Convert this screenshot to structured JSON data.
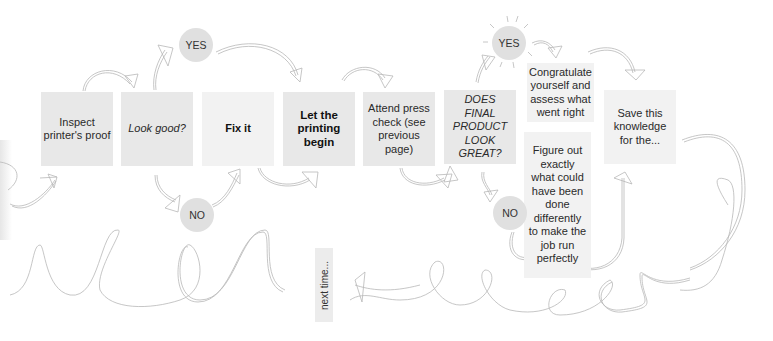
{
  "diagram": {
    "steps": [
      {
        "id": "inspect",
        "label": "Inspect printer's proof"
      },
      {
        "id": "look-good",
        "label": "Look good?"
      },
      {
        "id": "fix",
        "label": "Fix it"
      },
      {
        "id": "print",
        "label": "Let the printing begin"
      },
      {
        "id": "press-check",
        "label": "Attend press check (see previous page)"
      },
      {
        "id": "final-check",
        "label": "DOES FINAL PRODUCT LOOK GREAT?"
      },
      {
        "id": "congratulate",
        "label": "Congratulate yourself and assess what went right"
      },
      {
        "id": "figure-out",
        "label": "Figure out exactly what could have been done differently to make the job run perfectly"
      },
      {
        "id": "save",
        "label": "Save this knowledge for the..."
      },
      {
        "id": "next-time",
        "label": "next time..."
      }
    ],
    "decisions": [
      {
        "id": "yes-1",
        "label": "YES"
      },
      {
        "id": "no-1",
        "label": "NO"
      },
      {
        "id": "yes-2",
        "label": "YES"
      },
      {
        "id": "no-2",
        "label": "NO"
      }
    ],
    "colors": {
      "box": "#e8e8e8",
      "box_light": "#f2f2f2",
      "circle": "#e0e0e0",
      "line": "#b5b5b5",
      "text": "#2a2a2a"
    }
  }
}
